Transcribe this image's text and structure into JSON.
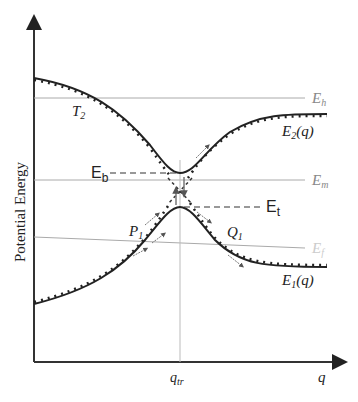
{
  "diagram": {
    "ylabel": "Potential Energy",
    "xlabel": "q",
    "x_tick": "q",
    "x_tick_sub": "tr",
    "levels": {
      "Eh": {
        "main": "E",
        "sub": "h"
      },
      "Em": {
        "main": "E",
        "sub": "m"
      },
      "Ef": {
        "main": "E",
        "sub": "f"
      }
    },
    "curves": {
      "upper": {
        "main": "E",
        "sub": "2",
        "suffix": "(q)"
      },
      "lower": {
        "main": "E",
        "sub": "1",
        "suffix": "(q)"
      }
    },
    "points": {
      "T2": {
        "main": "T",
        "sub": "2"
      },
      "P1": {
        "main": "P",
        "sub": "1"
      },
      "Q1": {
        "main": "Q",
        "sub": "1"
      }
    },
    "annotations": {
      "Eb": {
        "main": "E",
        "sub": "b"
      },
      "Et": {
        "main": "E",
        "sub": "t"
      }
    }
  }
}
